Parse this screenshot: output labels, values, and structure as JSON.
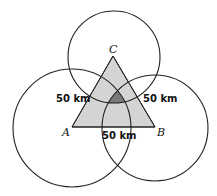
{
  "diagram": {
    "vertices": [
      {
        "name": "A",
        "label": "A"
      },
      {
        "name": "B",
        "label": "B"
      },
      {
        "name": "C",
        "label": "C"
      }
    ],
    "distance_labels": {
      "left": "50 km",
      "right": "50 km",
      "bottom": "50 km"
    },
    "colors": {
      "triangle_fill": "#d4d4d4",
      "intersection_fill": "#7a7a7a",
      "stroke": "#222222"
    }
  }
}
